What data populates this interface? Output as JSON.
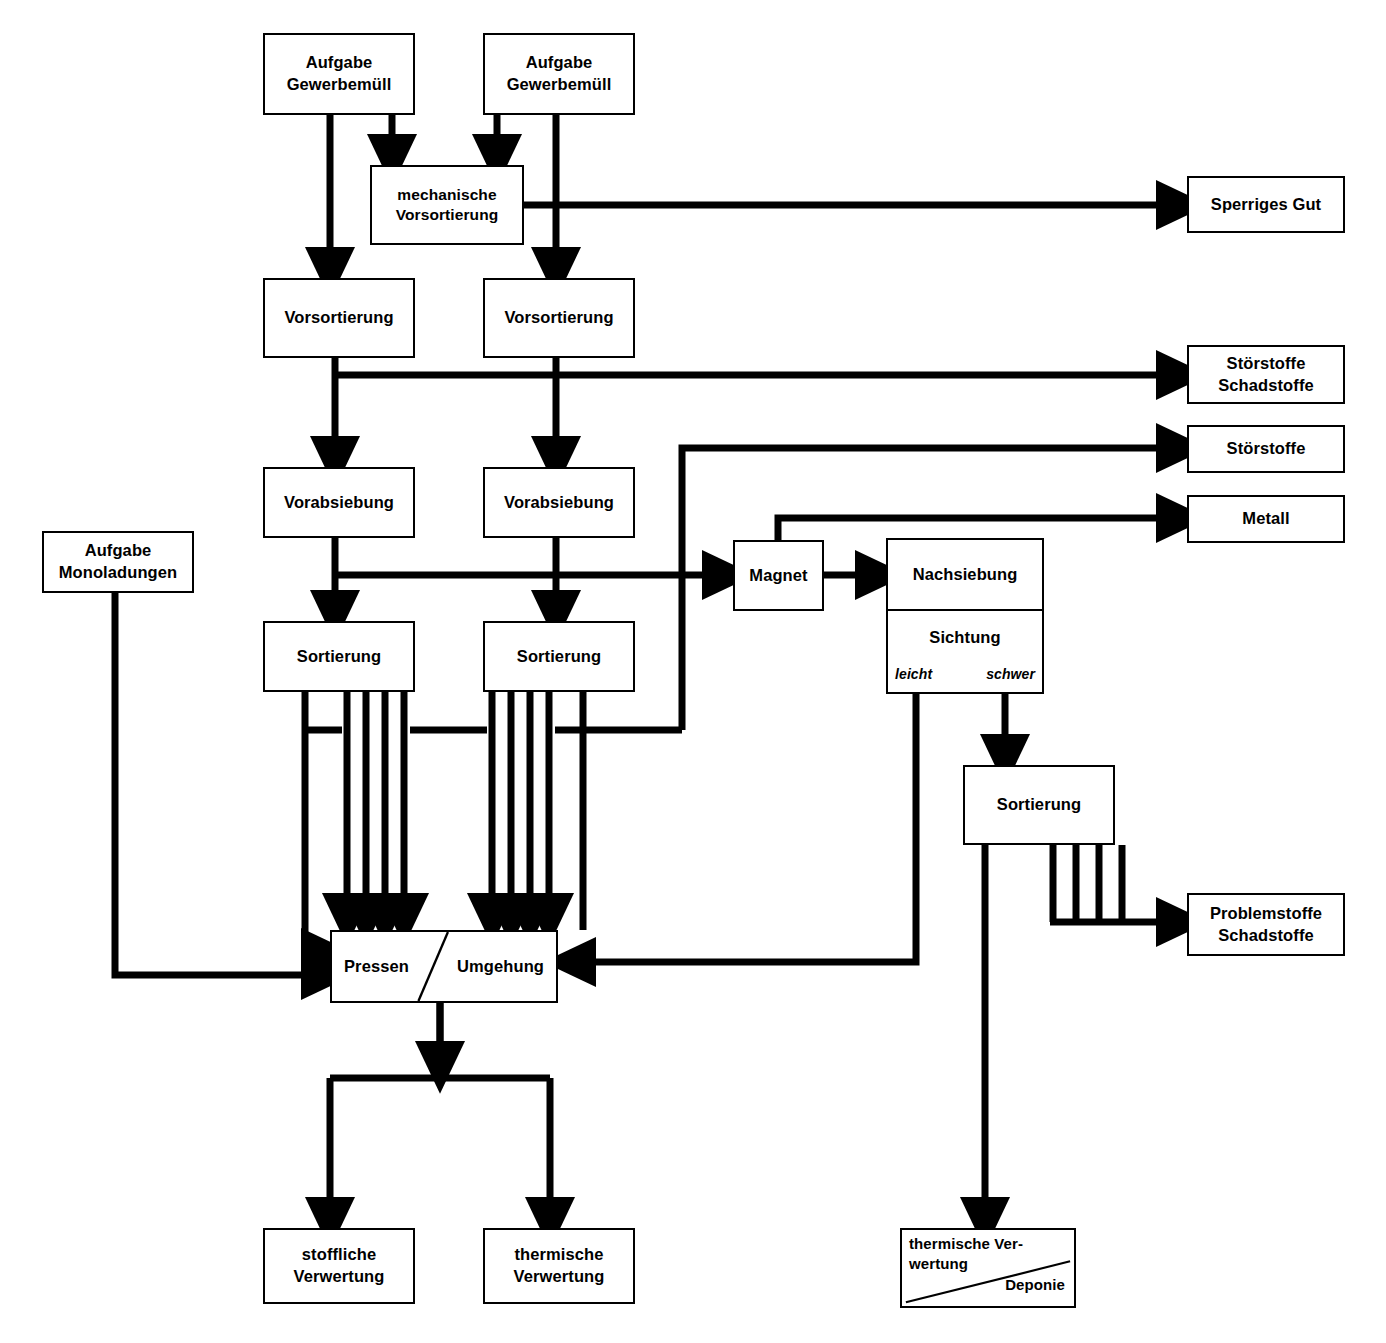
{
  "nodes": {
    "aufgabe1": {
      "line1": "Aufgabe",
      "line2": "Gewerbemüll"
    },
    "aufgabe2": {
      "line1": "Aufgabe",
      "line2": "Gewerbemüll"
    },
    "mech_vorsort": {
      "line1": "mechanische",
      "line2": "Vorsortierung"
    },
    "sperriges_gut": {
      "line1": "Sperriges Gut"
    },
    "vorsortierung1": {
      "line1": "Vorsortierung"
    },
    "vorsortierung2": {
      "line1": "Vorsortierung"
    },
    "stoerstoffe_schadstoffe": {
      "line1": "Störstoffe",
      "line2": "Schadstoffe"
    },
    "stoerstoffe": {
      "line1": "Störstoffe"
    },
    "vorabsiebung1": {
      "line1": "Vorabsiebung"
    },
    "vorabsiebung2": {
      "line1": "Vorabsiebung"
    },
    "metall": {
      "line1": "Metall"
    },
    "aufgabe_mono": {
      "line1": "Aufgabe",
      "line2": "Monoladungen"
    },
    "magnet": {
      "line1": "Magnet"
    },
    "nachsiebung": {
      "top": "Nachsiebung",
      "bottom": "Sichtung",
      "label_left": "leicht",
      "label_right": "schwer"
    },
    "sortierung1": {
      "line1": "Sortierung"
    },
    "sortierung2": {
      "line1": "Sortierung"
    },
    "sortierung3": {
      "line1": "Sortierung"
    },
    "problemstoffe": {
      "line1": "Problemstoffe",
      "line2": "Schadstoffe"
    },
    "pressen_umgehung": {
      "left": "Pressen",
      "right": "Umgehung"
    },
    "stoffliche_verwertung": {
      "line1": "stoffliche",
      "line2": "Verwertung"
    },
    "thermische_verwertung": {
      "line1": "thermische",
      "line2": "Verwertung"
    },
    "thermische_deponie": {
      "line1": "thermische Ver-",
      "line2": "wertung",
      "line3": "Deponie"
    }
  },
  "colors": {
    "stroke": "#000000",
    "background": "#ffffff"
  }
}
